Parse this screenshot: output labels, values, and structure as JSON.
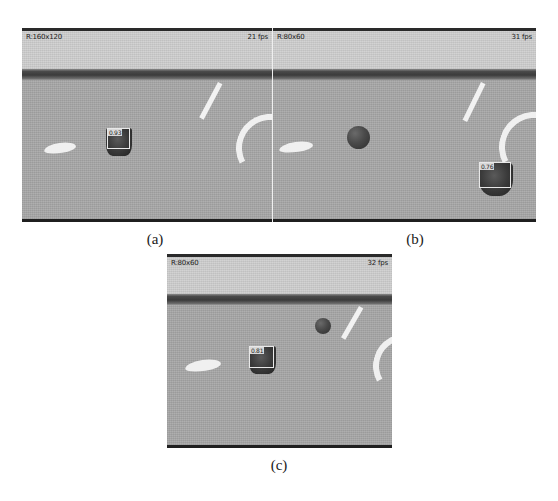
{
  "figure": {
    "panels": [
      {
        "id": "a",
        "caption": "(a)",
        "hud_resolution": "R:160x120",
        "hud_framerate": "21 fps",
        "tracked_object_label": "0.93",
        "has_ball": false,
        "has_tracked_box": true
      },
      {
        "id": "b",
        "caption": "(b)",
        "hud_resolution": "R:80x60",
        "hud_framerate": "31 fps",
        "tracked_object_label": "0.76",
        "has_ball": true,
        "has_tracked_box": true
      },
      {
        "id": "c",
        "caption": "(c)",
        "hud_resolution": "R:80x60",
        "hud_framerate": "32 fps",
        "tracked_object_label": "0.81",
        "has_ball": true,
        "has_tracked_box": true
      }
    ]
  },
  "colors": {
    "sky": "#cfcfcf",
    "field": "#a8a8a8",
    "wall": "#3b3b3b",
    "marking": "#f2f2f2",
    "ball": "#2d2d2d",
    "bbox_outline": "#e8e8e8",
    "hud_text": "#1c1c1c",
    "page_background": "#ffffff"
  }
}
